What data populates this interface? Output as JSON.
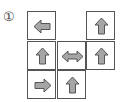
{
  "puzzle": {
    "label": "①",
    "colors": {
      "arrow_fill": "#a6a6a6",
      "arrow_stroke": "#555555",
      "grid_line": "#555555"
    },
    "cells": [
      {
        "row": 0,
        "col": 0,
        "arrow": "left"
      },
      {
        "row": 0,
        "col": 2,
        "arrow": "up"
      },
      {
        "row": 1,
        "col": 0,
        "arrow": "up"
      },
      {
        "row": 1,
        "col": 1,
        "arrow": "left-right"
      },
      {
        "row": 1,
        "col": 2,
        "arrow": "up"
      },
      {
        "row": 2,
        "col": 0,
        "arrow": "right"
      },
      {
        "row": 2,
        "col": 1,
        "arrow": "up"
      }
    ]
  }
}
